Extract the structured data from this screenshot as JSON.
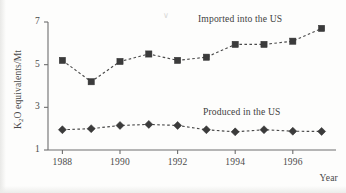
{
  "chart_data": {
    "type": "line",
    "title": "",
    "xlabel": "Year",
    "ylabel": "K2O equivalents/Mt",
    "ylabel_html": "K<sub>2</sub>O equivalents/Mt",
    "x": [
      1988,
      1989,
      1990,
      1991,
      1992,
      1993,
      1994,
      1995,
      1996,
      1997
    ],
    "xlim": [
      1987.5,
      1997.5
    ],
    "ylim": [
      1,
      7
    ],
    "xticks": [
      1988,
      1990,
      1992,
      1994,
      1996
    ],
    "xtick_labels": [
      "1988",
      "1990",
      "1992",
      "1994",
      "1996"
    ],
    "yticks": [
      1,
      3,
      5,
      7
    ],
    "ytick_labels": [
      "1",
      "3",
      "5",
      "7"
    ],
    "grid": false,
    "legend_position": "inline-annotation",
    "series": [
      {
        "name": "Imported into the US",
        "marker": "square",
        "linestyle": "dashed",
        "color": "#3b3b3b",
        "values": [
          5.2,
          4.2,
          5.15,
          5.5,
          5.2,
          5.35,
          5.95,
          5.95,
          6.1,
          6.7
        ]
      },
      {
        "name": "Produced in the US",
        "marker": "diamond",
        "linestyle": "dashed",
        "color": "#3b3b3b",
        "values": [
          1.95,
          2.0,
          2.15,
          2.2,
          2.15,
          1.95,
          1.85,
          1.95,
          1.88,
          1.87
        ]
      }
    ],
    "annotations": [
      {
        "text": "Imported into the US",
        "series": "Imported into the US"
      },
      {
        "text": "Produced in the US",
        "series": "Produced in the US"
      }
    ]
  }
}
